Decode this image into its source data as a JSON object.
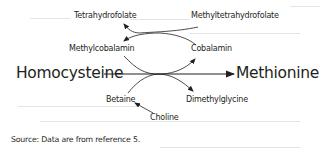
{
  "diagram": {
    "nodes": {
      "tetrahydrofolate": "Tetrahydrofolate",
      "methyltetrahydrofolate": "Methyltetrahydrofolate",
      "methylcobalamin": "Methylcobalamin",
      "cobalamin": "Cobalamin",
      "homocysteine": "Homocysteine",
      "methionine": "Methionine",
      "betaine": "Betaine",
      "dimethylglycine": "Dimethylglycine",
      "choline": "Choline"
    },
    "edges": [
      {
        "from": "Homocysteine",
        "to": "Methionine"
      },
      {
        "from": "Methyltetrahydrofolate",
        "to": "Tetrahydrofolate"
      },
      {
        "from": "Cobalamin",
        "to": "Methylcobalamin"
      },
      {
        "from": "Methylcobalamin",
        "to": "Cobalamin"
      },
      {
        "from": "Betaine",
        "to": "Dimethylglycine"
      },
      {
        "from": "Choline",
        "to": "Betaine"
      }
    ],
    "colors": {
      "text": "#231f20",
      "line": "#231f20",
      "background": "#ffffff"
    }
  },
  "source_note": "Source: Data are from reference 5."
}
